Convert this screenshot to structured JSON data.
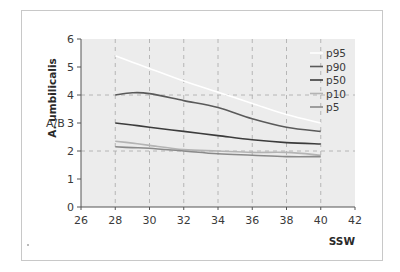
{
  "chart_data": {
    "type": "line",
    "title": "",
    "ylabel": "A. umbilicalis",
    "ylabel_secondary": "A/B",
    "xlabel": "SSW",
    "xlim": [
      26,
      42
    ],
    "ylim": [
      0,
      6
    ],
    "xticks": [
      "26",
      "28",
      "30",
      "32",
      "34",
      "36",
      "38",
      "40",
      "42"
    ],
    "yticks": [
      "0",
      "1",
      "2",
      "3",
      "4",
      "5",
      "6"
    ],
    "grid": "dashed, at x=28..40 and y=2, y=4",
    "legend_position": "upper right",
    "x": [
      28,
      29,
      30,
      32,
      34,
      36,
      38,
      40
    ],
    "series": [
      {
        "name": "p95",
        "color": "#ffffff",
        "values": [
          5.4,
          5.17,
          4.95,
          4.5,
          4.1,
          3.7,
          3.3,
          3.0
        ]
      },
      {
        "name": "p90",
        "color": "#5a5a5a",
        "values": [
          4.0,
          4.08,
          4.05,
          3.8,
          3.55,
          3.15,
          2.85,
          2.7
        ]
      },
      {
        "name": "p50",
        "color": "#3c3c3c",
        "values": [
          3.0,
          2.93,
          2.85,
          2.7,
          2.55,
          2.4,
          2.3,
          2.25
        ]
      },
      {
        "name": "p10",
        "color": "#b4b4b4",
        "values": [
          2.35,
          2.28,
          2.2,
          2.05,
          2.0,
          1.95,
          1.95,
          1.85
        ]
      },
      {
        "name": "p5",
        "color": "#8a8a8a",
        "values": [
          2.15,
          2.12,
          2.1,
          2.0,
          1.9,
          1.85,
          1.8,
          1.8
        ]
      }
    ]
  },
  "colors": {
    "plot_bg": "#ececec",
    "grid": "#a8a8a8",
    "axis": "#555555",
    "frame": "#c8c8c8"
  }
}
